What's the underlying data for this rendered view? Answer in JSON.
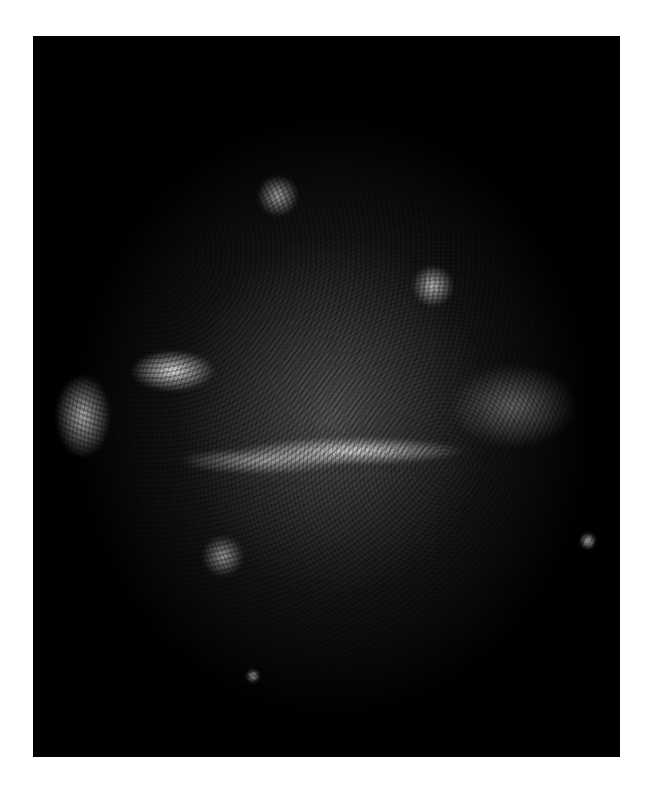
{
  "image": {
    "subject": "supernova-remnant",
    "palette": {
      "background": "#ffffff",
      "frame": "#000000",
      "emission": "#ffffff"
    }
  }
}
